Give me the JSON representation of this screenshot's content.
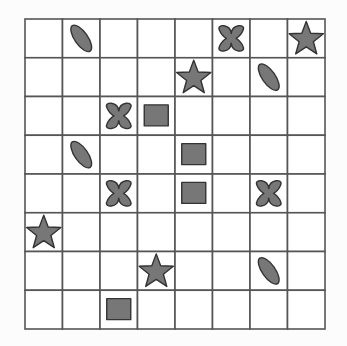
{
  "board": {
    "rows": 8,
    "cols": 8,
    "grid_color": "#555555",
    "shape_fill": "#777777",
    "shape_stroke": "#333333",
    "pieces": [
      {
        "row": 0,
        "col": 1,
        "shape": "ellipse"
      },
      {
        "row": 0,
        "col": 5,
        "shape": "cross"
      },
      {
        "row": 0,
        "col": 7,
        "shape": "star"
      },
      {
        "row": 1,
        "col": 4,
        "shape": "star"
      },
      {
        "row": 1,
        "col": 6,
        "shape": "ellipse"
      },
      {
        "row": 2,
        "col": 2,
        "shape": "cross"
      },
      {
        "row": 2,
        "col": 3,
        "shape": "square"
      },
      {
        "row": 3,
        "col": 1,
        "shape": "ellipse"
      },
      {
        "row": 3,
        "col": 4,
        "shape": "square"
      },
      {
        "row": 4,
        "col": 2,
        "shape": "cross"
      },
      {
        "row": 4,
        "col": 4,
        "shape": "square"
      },
      {
        "row": 4,
        "col": 6,
        "shape": "cross"
      },
      {
        "row": 5,
        "col": 0,
        "shape": "star"
      },
      {
        "row": 6,
        "col": 3,
        "shape": "star"
      },
      {
        "row": 6,
        "col": 6,
        "shape": "ellipse"
      },
      {
        "row": 7,
        "col": 2,
        "shape": "square"
      }
    ]
  }
}
